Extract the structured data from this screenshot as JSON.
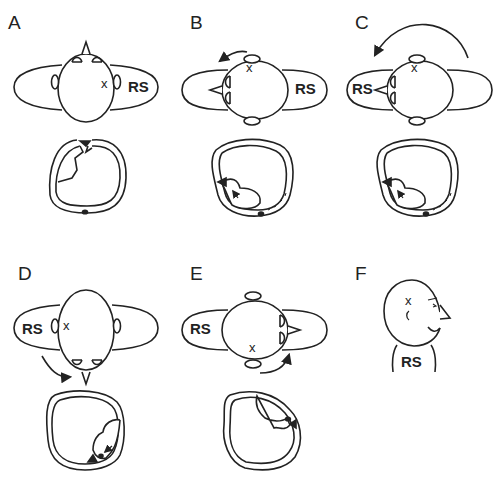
{
  "figure": {
    "panels": [
      {
        "id": "A",
        "label": "A",
        "body_label": "RS",
        "marker": "x",
        "rotation_arrow": "none"
      },
      {
        "id": "B",
        "label": "B",
        "body_label": "RS",
        "marker": "x",
        "rotation_arrow": "counterclockwise"
      },
      {
        "id": "C",
        "label": "C",
        "body_label": "RS",
        "marker": "x",
        "rotation_arrow": "counterclockwise-large"
      },
      {
        "id": "D",
        "label": "D",
        "body_label": "RS",
        "marker": "x",
        "rotation_arrow": "counterclockwise"
      },
      {
        "id": "E",
        "label": "E",
        "body_label": "RS",
        "marker": "x",
        "rotation_arrow": "counterclockwise"
      },
      {
        "id": "F",
        "label": "F",
        "body_label": "RS",
        "marker": "x",
        "rotation_arrow": "none"
      }
    ],
    "colors": {
      "line": "#222222",
      "background": "#ffffff"
    }
  }
}
